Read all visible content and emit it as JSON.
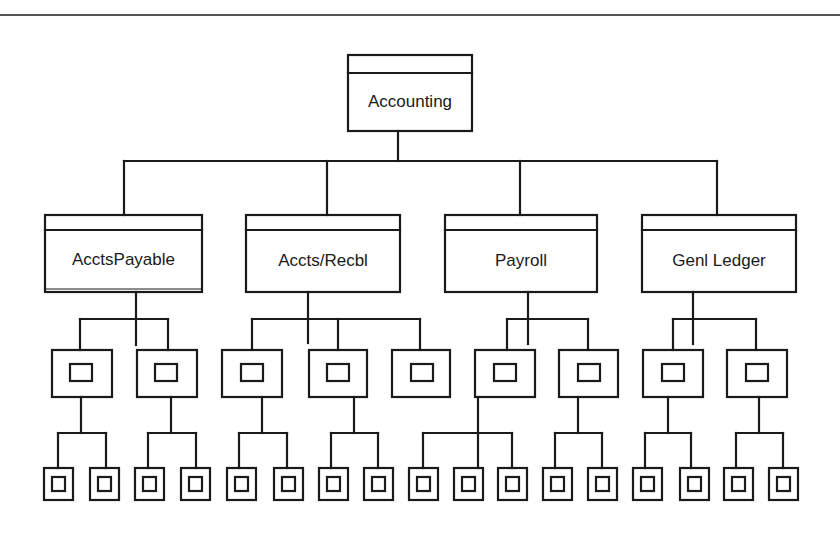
{
  "diagram": {
    "type": "hierarchy",
    "root": {
      "label": "Accounting",
      "children": [
        {
          "label": "AcctsPayable",
          "children": [
            {
              "label": "",
              "children": [
                {
                  "label": ""
                },
                {
                  "label": ""
                }
              ]
            },
            {
              "label": "",
              "children": [
                {
                  "label": ""
                },
                {
                  "label": ""
                }
              ]
            }
          ]
        },
        {
          "label": "Accts/Recbl",
          "children": [
            {
              "label": "",
              "children": [
                {
                  "label": ""
                },
                {
                  "label": ""
                }
              ]
            },
            {
              "label": "",
              "children": [
                {
                  "label": ""
                },
                {
                  "label": ""
                }
              ]
            },
            {
              "label": "",
              "children": []
            }
          ]
        },
        {
          "label": "Payroll",
          "children": [
            {
              "label": "",
              "children": [
                {
                  "label": ""
                },
                {
                  "label": ""
                },
                {
                  "label": ""
                }
              ]
            },
            {
              "label": "",
              "children": [
                {
                  "label": ""
                },
                {
                  "label": ""
                }
              ]
            }
          ]
        },
        {
          "label": "Genl Ledger",
          "children": [
            {
              "label": "",
              "children": [
                {
                  "label": ""
                },
                {
                  "label": ""
                }
              ]
            },
            {
              "label": "",
              "children": [
                {
                  "label": ""
                },
                {
                  "label": ""
                }
              ]
            }
          ]
        }
      ]
    }
  },
  "colors": {
    "line": "#1a1a1a",
    "background": "#ffffff"
  }
}
